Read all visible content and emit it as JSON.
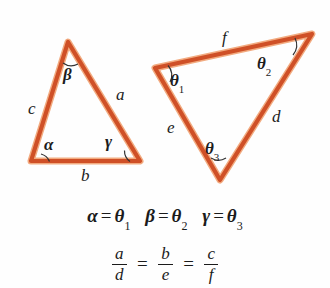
{
  "figure": {
    "title_visible": false,
    "background_color": "#fefefe",
    "stroke_color": "#cf5027",
    "stroke_highlight_color": "#f0a070",
    "arc_color": "#2a2a2a",
    "text_color": "#1b1b1b"
  },
  "triangle_left": {
    "name": "triangle-abc",
    "vertices": {
      "apex": [
        68,
        42
      ],
      "bottom_left": [
        31,
        161
      ],
      "bottom_right": [
        140,
        161
      ]
    },
    "side_labels": [
      {
        "id": "side-a",
        "text": "a",
        "x": 116,
        "y": 86
      },
      {
        "id": "side-b",
        "text": "b",
        "x": 81,
        "y": 167
      },
      {
        "id": "side-c",
        "text": "c",
        "x": 28,
        "y": 100
      }
    ],
    "angle_labels": [
      {
        "id": "angle-alpha",
        "text": "α",
        "x": 44,
        "y": 136
      },
      {
        "id": "angle-beta",
        "text": "β",
        "x": 63,
        "y": 66
      },
      {
        "id": "angle-gamma",
        "text": "γ",
        "x": 105,
        "y": 133
      }
    ]
  },
  "triangle_right": {
    "name": "triangle-def",
    "vertices": {
      "left": [
        155,
        68
      ],
      "top_right": [
        312,
        34
      ],
      "bottom": [
        220,
        180
      ]
    },
    "side_labels": [
      {
        "id": "side-d",
        "text": "d",
        "x": 272,
        "y": 108
      },
      {
        "id": "side-e",
        "text": "e",
        "x": 167,
        "y": 119
      },
      {
        "id": "side-f",
        "text": "f",
        "x": 222,
        "y": 29
      }
    ],
    "angle_labels": [
      {
        "id": "angle-theta-1",
        "base": "θ",
        "sub": "1",
        "x": 170,
        "y": 72
      },
      {
        "id": "angle-theta-2",
        "base": "θ",
        "sub": "2",
        "x": 257,
        "y": 55
      },
      {
        "id": "angle-theta-3",
        "base": "θ",
        "sub": "3",
        "x": 205,
        "y": 140
      }
    ]
  },
  "equations": {
    "angles": {
      "pairs": [
        {
          "left": "α",
          "operator": "=",
          "right_base": "θ",
          "right_sub": "1"
        },
        {
          "left": "β",
          "operator": "=",
          "right_base": "θ",
          "right_sub": "2"
        },
        {
          "left": "γ",
          "operator": "=",
          "right_base": "θ",
          "right_sub": "3"
        }
      ],
      "plain_text": "α = θ₁  β = θ₂  γ = θ₃"
    },
    "ratios": {
      "fractions": [
        {
          "numerator": "a",
          "denominator": "d"
        },
        {
          "numerator": "b",
          "denominator": "e"
        },
        {
          "numerator": "c",
          "denominator": "f"
        }
      ],
      "operators": [
        "=",
        "="
      ],
      "plain_text": "a/d = b/e = c/f"
    }
  }
}
